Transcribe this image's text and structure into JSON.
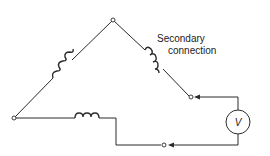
{
  "diagram": {
    "type": "delta-transformer-secondary-voltmeter-test",
    "label_line1": "Secondary",
    "label_line2": "connection",
    "meter": {
      "symbol": "V",
      "name": "voltmeter"
    },
    "windings": [
      {
        "name": "left-winding",
        "position": "left diagonal"
      },
      {
        "name": "right-winding",
        "position": "right diagonal"
      },
      {
        "name": "bottom-winding",
        "position": "bottom horizontal"
      }
    ],
    "terminals": [
      {
        "name": "top-node"
      },
      {
        "name": "left-node"
      },
      {
        "name": "upper-right-terminal"
      },
      {
        "name": "bottom-terminal"
      }
    ],
    "colors": {
      "line": "#2a2a2a",
      "background": "#ffffff"
    }
  }
}
